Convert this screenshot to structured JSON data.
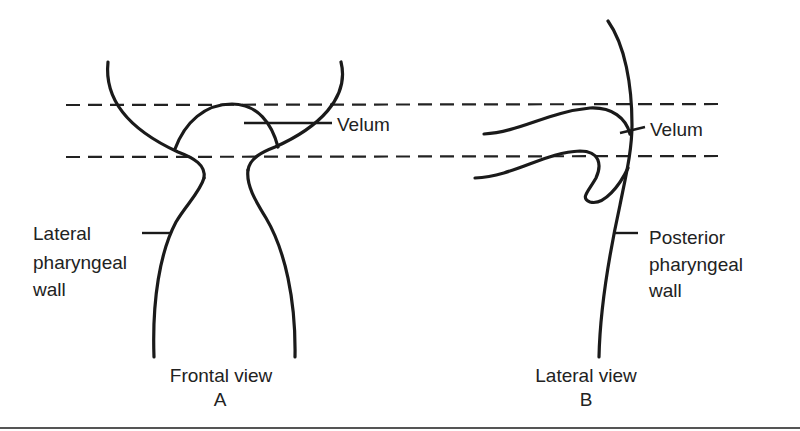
{
  "diagram": {
    "levels": {
      "upper_dashed_line": "velum upper level",
      "lower_dashed_line": "velum lower level"
    },
    "panel_a": {
      "view_label": "Frontal view",
      "letter": "A",
      "velum_label": "Velum",
      "lateral_wall_label": {
        "line1": "Lateral",
        "line2": "pharyngeal",
        "line3": "wall"
      }
    },
    "panel_b": {
      "view_label": "Lateral view",
      "letter": "B",
      "velum_label": "Velum",
      "posterior_wall_label": {
        "line1": "Posterior",
        "line2": "pharyngeal",
        "line3": "wall"
      }
    },
    "colors": {
      "ink": "#1a1a1a",
      "background": "#ffffff",
      "rule": "#555555"
    }
  }
}
